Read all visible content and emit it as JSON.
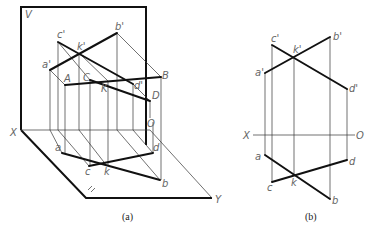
{
  "figure_a": {
    "caption": "(a)",
    "plane_labels": {
      "V": "V",
      "X": "X",
      "Y": "Y",
      "O": "O",
      "H": "H"
    },
    "point_labels": {
      "a_prime": "a'",
      "b_prime": "b'",
      "c_prime": "c'",
      "d_prime": "d'",
      "k_prime": "k'",
      "A": "A",
      "B": "B",
      "C": "C",
      "D": "D",
      "K": "K",
      "a": "a",
      "b": "b",
      "c": "c",
      "d": "d",
      "k": "k"
    }
  },
  "figure_b": {
    "caption": "(b)",
    "axis_labels": {
      "X": "X",
      "O": "O"
    },
    "point_labels": {
      "a_prime": "a'",
      "b_prime": "b'",
      "c_prime": "c'",
      "d_prime": "d'",
      "k_prime": "k'",
      "a": "a",
      "b": "b",
      "c": "c",
      "d": "d",
      "k": "k"
    }
  }
}
